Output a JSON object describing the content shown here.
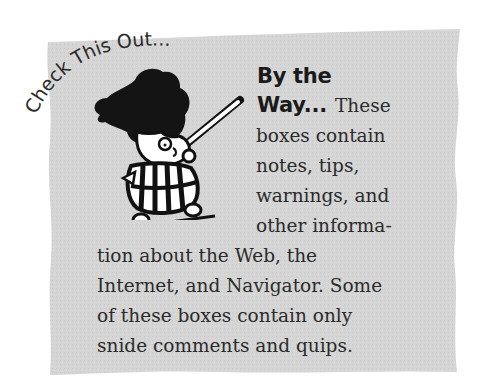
{
  "sidebar": {
    "badge_text": "Check This Out...",
    "heading_lines": [
      "By the",
      "Way..."
    ],
    "body_first_word": "These",
    "body_right_lines": [
      "boxes contain",
      "notes, tips,",
      "warnings, and",
      "other informa-"
    ],
    "body_bottom_lines": [
      "tion about the Web, the",
      "Internet, and Navigator. Some",
      "of these boxes contain only",
      "snide comments and quips."
    ],
    "colors": {
      "box_fill": "#d3d3d3",
      "text": "#2a2a2a",
      "heading": "#1a1a1a"
    },
    "illustration": "cartoon-character-with-pointer"
  }
}
